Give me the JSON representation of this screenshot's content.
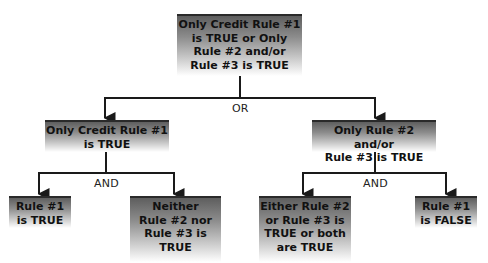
{
  "diagram": {
    "type": "logic-tree",
    "root": {
      "text": "Only Credit Rule #1 is TRUE or Only Rule #2 and/or Rule #3 is TRUE",
      "lines": [
        "Only Credit Rule #1",
        "is TRUE or Only",
        "Rule #2 and/or",
        "Rule #3 is TRUE"
      ]
    },
    "level1_connector": "OR",
    "level1": [
      {
        "text": "Only Credit Rule #1 is TRUE",
        "lines": [
          "Only Credit Rule #1",
          "is TRUE"
        ],
        "connector": "AND",
        "children": [
          {
            "text": "Rule #1 is TRUE",
            "lines": [
              "Rule #1",
              "is TRUE"
            ]
          },
          {
            "text": "Neither Rule #2 nor Rule #3 is TRUE",
            "lines": [
              "Neither",
              "Rule #2 nor",
              "Rule #3 is",
              "TRUE"
            ]
          }
        ]
      },
      {
        "text": "Only Rule #2 and/or Rule #3 is TRUE",
        "lines": [
          "Only Rule #2 and/or",
          "Rule #3 is TRUE"
        ],
        "connector": "AND",
        "children": [
          {
            "text": "Either Rule #2 or Rule #3 is TRUE or both are TRUE",
            "lines": [
              "Either Rule #2",
              "or Rule #3 is",
              "TRUE or both",
              "are TRUE"
            ]
          },
          {
            "text": "Rule #1 is FALSE",
            "lines": [
              "Rule #1",
              "is FALSE"
            ]
          }
        ]
      }
    ]
  },
  "colors": {
    "box_dark": "#5e5e5e",
    "box_light": "#ffffff",
    "line": "#1a1a1a",
    "text": "#111111"
  }
}
